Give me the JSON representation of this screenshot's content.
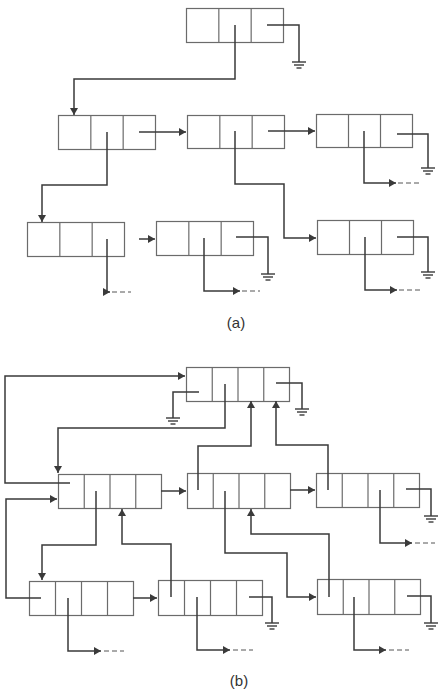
{
  "figures": [
    {
      "id": "a",
      "caption": "(a)",
      "caption_pos": [
        236,
        314
      ],
      "cells_per_node": 3,
      "nodes": [
        {
          "id": "a-root",
          "x": 186,
          "y": 8,
          "w": 97,
          "h": 34
        },
        {
          "id": "a-r2-1",
          "x": 58,
          "y": 115,
          "w": 97,
          "h": 34
        },
        {
          "id": "a-r2-2",
          "x": 187,
          "y": 115,
          "w": 97,
          "h": 33
        },
        {
          "id": "a-r2-3",
          "x": 316,
          "y": 114,
          "w": 96,
          "h": 33
        },
        {
          "id": "a-r3-1",
          "x": 27,
          "y": 222,
          "w": 97,
          "h": 34
        },
        {
          "id": "a-r3-2",
          "x": 156,
          "y": 221,
          "w": 97,
          "h": 34
        },
        {
          "id": "a-r3-3",
          "x": 317,
          "y": 220,
          "w": 96,
          "h": 34
        }
      ],
      "arrows": [
        {
          "pts": [
            [
              235,
              25
            ],
            [
              235,
              79
            ],
            [
              74,
              79
            ],
            [
              74,
              115
            ]
          ],
          "head": "down"
        },
        {
          "pts": [
            [
              139,
              132
            ],
            [
              186,
              132
            ]
          ],
          "head": "right"
        },
        {
          "pts": [
            [
              268,
              131
            ],
            [
              315,
              131
            ]
          ],
          "head": "right"
        },
        {
          "pts": [
            [
              107,
              132
            ],
            [
              107,
              185
            ],
            [
              42,
              185
            ],
            [
              42,
              222
            ]
          ],
          "head": "down"
        },
        {
          "pts": [
            [
              235,
              131
            ],
            [
              235,
              184
            ],
            [
              284,
              184
            ],
            [
              284,
              238
            ],
            [
              316,
              238
            ]
          ],
          "head": "right"
        },
        {
          "pts": [
            [
              107,
              239
            ],
            [
              107,
              292
            ],
            [
              110,
              292
            ]
          ],
          "head": "right",
          "dashed_tail": [
            [
              112,
              292
            ],
            [
              131,
              292
            ]
          ]
        },
        {
          "pts": [
            [
              139,
              239
            ],
            [
              155,
              239
            ]
          ],
          "head": "right"
        },
        {
          "pts": [
            [
              204,
              238
            ],
            [
              204,
              291
            ],
            [
              240,
              291
            ]
          ],
          "head": "right",
          "dashed_tail": [
            [
              242,
              291
            ],
            [
              260,
              291
            ]
          ]
        },
        {
          "pts": [
            [
              364,
              131
            ],
            [
              364,
              183
            ],
            [
              396,
              183
            ]
          ],
          "head": "right",
          "dashed_tail": [
            [
              398,
              183
            ],
            [
              420,
              183
            ]
          ]
        },
        {
          "pts": [
            [
              365,
              237
            ],
            [
              365,
              290
            ],
            [
              397,
              290
            ]
          ],
          "head": "right",
          "dashed_tail": [
            [
              399,
              290
            ],
            [
              421,
              290
            ]
          ]
        }
      ],
      "lines": [
        {
          "pts": [
            [
              267,
              25
            ],
            [
              299,
              25
            ],
            [
              299,
              62
            ]
          ]
        },
        {
          "pts": [
            [
              236,
              237
            ],
            [
              268,
              237
            ],
            [
              268,
              274
            ]
          ]
        },
        {
          "pts": [
            [
              397,
              134
            ],
            [
              428,
              134
            ],
            [
              428,
              168
            ]
          ]
        },
        {
          "pts": [
            [
              397,
              237
            ],
            [
              428,
              237
            ],
            [
              428,
              272
            ]
          ]
        }
      ],
      "grounds": [
        [
          299,
          62
        ],
        [
          268,
          274
        ],
        [
          428,
          168
        ],
        [
          428,
          272
        ]
      ]
    },
    {
      "id": "b",
      "caption": "(b)",
      "caption_pos": [
        239,
        672
      ],
      "cells_per_node": 4,
      "nodes": [
        {
          "id": "b-root",
          "x": 186,
          "y": 367,
          "w": 103,
          "h": 34
        },
        {
          "id": "b-r2-1",
          "x": 58,
          "y": 474,
          "w": 103,
          "h": 34
        },
        {
          "id": "b-r2-2",
          "x": 187,
          "y": 473,
          "w": 103,
          "h": 35
        },
        {
          "id": "b-r2-3",
          "x": 316,
          "y": 473,
          "w": 103,
          "h": 34
        },
        {
          "id": "b-r3-1",
          "x": 29,
          "y": 581,
          "w": 104,
          "h": 34
        },
        {
          "id": "b-r3-2",
          "x": 158,
          "y": 580,
          "w": 104,
          "h": 35
        },
        {
          "id": "b-r3-3",
          "x": 317,
          "y": 579,
          "w": 103,
          "h": 35
        }
      ],
      "arrows": [
        {
          "pts": [
            [
              70,
              483
            ],
            [
              5,
              483
            ],
            [
              5,
              376
            ],
            [
              185,
              376
            ]
          ],
          "head": "right"
        },
        {
          "pts": [
            [
              225,
              384
            ],
            [
              225,
              428
            ],
            [
              58,
              428
            ],
            [
              58,
              473
            ]
          ],
          "head": "down"
        },
        {
          "pts": [
            [
              161,
              491
            ],
            [
              186,
              491
            ]
          ],
          "head": "right"
        },
        {
          "pts": [
            [
              290,
              490
            ],
            [
              315,
              490
            ]
          ],
          "head": "right"
        },
        {
          "pts": [
            [
              198,
              490
            ],
            [
              198,
              446
            ],
            [
              251,
              446
            ],
            [
              251,
              401
            ]
          ],
          "head": "up"
        },
        {
          "pts": [
            [
              328,
              490
            ],
            [
              328,
              445
            ],
            [
              276,
              445
            ],
            [
              276,
              401
            ]
          ],
          "head": "up"
        },
        {
          "pts": [
            [
              96,
              491
            ],
            [
              96,
              545
            ],
            [
              42,
              545
            ],
            [
              42,
              580
            ]
          ],
          "head": "down"
        },
        {
          "pts": [
            [
              171,
              597
            ],
            [
              171,
              544
            ],
            [
              122,
              544
            ],
            [
              122,
              509
            ]
          ],
          "head": "up"
        },
        {
          "pts": [
            [
              41,
              598
            ],
            [
              6,
              598
            ],
            [
              6,
              499
            ],
            [
              57,
              499
            ]
          ],
          "head": "right"
        },
        {
          "pts": [
            [
              133,
              598
            ],
            [
              157,
              598
            ]
          ],
          "head": "right"
        },
        {
          "pts": [
            [
              225,
              491
            ],
            [
              225,
              553
            ],
            [
              287,
              553
            ],
            [
              287,
              597
            ],
            [
              316,
              597
            ]
          ],
          "head": "right"
        },
        {
          "pts": [
            [
              329,
              597
            ],
            [
              329,
              534
            ],
            [
              251,
              534
            ],
            [
              251,
              509
            ]
          ],
          "head": "up"
        },
        {
          "pts": [
            [
              68,
              598
            ],
            [
              68,
              651
            ],
            [
              101,
              651
            ]
          ],
          "head": "right",
          "dashed_tail": [
            [
              104,
              651
            ],
            [
              124,
              651
            ]
          ]
        },
        {
          "pts": [
            [
              197,
              597
            ],
            [
              197,
              650
            ],
            [
              230,
              650
            ]
          ],
          "head": "right",
          "dashed_tail": [
            [
              233,
              650
            ],
            [
              253,
              650
            ]
          ]
        },
        {
          "pts": [
            [
              354,
              597
            ],
            [
              354,
              650
            ],
            [
              386,
              650
            ]
          ],
          "head": "right",
          "dashed_tail": [
            [
              389,
              650
            ],
            [
              409,
              650
            ]
          ]
        },
        {
          "pts": [
            [
              380,
              490
            ],
            [
              380,
              543
            ],
            [
              412,
              543
            ]
          ],
          "head": "right",
          "dashed_tail": [
            [
              415,
              543
            ],
            [
              435,
              543
            ]
          ]
        }
      ],
      "lines": [
        {
          "pts": [
            [
              199,
              392
            ],
            [
              173,
              392
            ],
            [
              173,
              418
            ]
          ]
        },
        {
          "pts": [
            [
              276,
              383
            ],
            [
              302,
              383
            ],
            [
              302,
              409
            ]
          ]
        },
        {
          "pts": [
            [
              406,
              489
            ],
            [
              431,
              489
            ],
            [
              431,
              516
            ]
          ]
        },
        {
          "pts": [
            [
              249,
              597
            ],
            [
              272,
              597
            ],
            [
              272,
              623
            ]
          ]
        },
        {
          "pts": [
            [
              407,
              596
            ],
            [
              431,
              596
            ],
            [
              431,
              623
            ]
          ]
        }
      ],
      "grounds": [
        [
          173,
          418
        ],
        [
          302,
          409
        ],
        [
          431,
          516
        ],
        [
          272,
          623
        ],
        [
          431,
          623
        ]
      ]
    }
  ],
  "style": {
    "box_stroke": "#6b6b6b",
    "line_stroke": "#3a3a3a",
    "background": "#ffffff"
  }
}
